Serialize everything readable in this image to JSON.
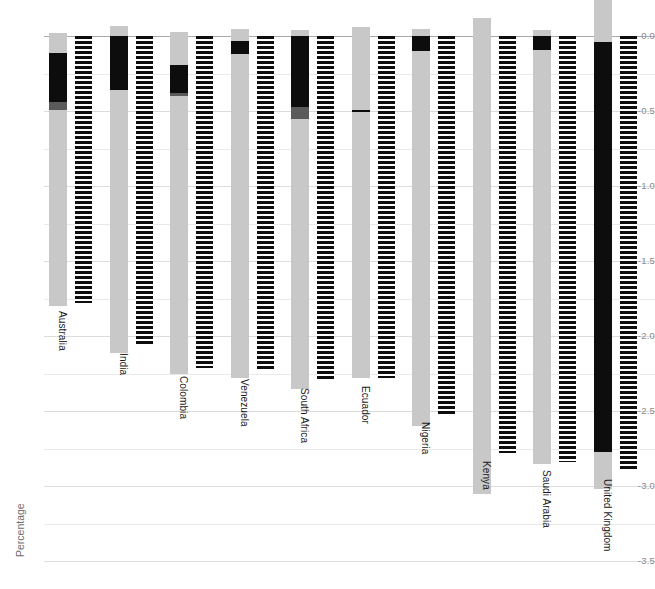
{
  "chart_data": {
    "type": "bar",
    "title": "",
    "xlabel": "",
    "ylabel": "Percentage",
    "ylim": [
      -3.62,
      0.32
    ],
    "grid": true,
    "gridline_step": 0.25,
    "legend": "none",
    "ytick_labels": [
      "0.0",
      "-0.5",
      "-1.0",
      "-1.5",
      "-2.0",
      "-2.5",
      "-3.0",
      "-3.5"
    ],
    "ytick_values": [
      0.0,
      -0.5,
      -1.0,
      -1.5,
      -2.0,
      -2.5,
      -3.0,
      -3.5
    ],
    "categories": [
      "Australia",
      "India",
      "Colombia",
      "Venezuela",
      "South Africa",
      "Ecuador",
      "Nigeria",
      "Kenya",
      "Saudi Arabia",
      "United Kingdom"
    ],
    "series": [
      {
        "name": "solid-bar",
        "style": "solid-grey",
        "color": "#c8c8c8",
        "tops": [
          0.02,
          0.07,
          0.03,
          0.05,
          0.04,
          0.06,
          0.05,
          0.12,
          0.04,
          0.24
        ],
        "values": [
          -1.8,
          -2.11,
          -2.25,
          -2.28,
          -2.35,
          -2.28,
          -2.6,
          -3.05,
          -2.85,
          -3.02
        ]
      },
      {
        "name": "hatched-bar",
        "style": "hatched-black",
        "color": "#0d0d0d",
        "tops": [
          0.0,
          0.0,
          0.0,
          0.0,
          0.0,
          0.0,
          0.0,
          0.0,
          0.0,
          0.0
        ],
        "values": [
          -1.78,
          -2.06,
          -2.21,
          -2.23,
          -2.29,
          -2.28,
          -2.52,
          -2.78,
          -2.84,
          -2.9
        ]
      }
    ],
    "overlay_segments": [
      {
        "category": "Australia",
        "black_from": -0.11,
        "black_to": -0.44,
        "dark_from": -0.44,
        "dark_to": -0.49
      },
      {
        "category": "India",
        "black_from": 0.0,
        "black_to": -0.36,
        "dark_from": null,
        "dark_to": null
      },
      {
        "category": "Colombia",
        "black_from": -0.19,
        "black_to": -0.38,
        "dark_from": -0.38,
        "dark_to": -0.4
      },
      {
        "category": "Venezuela",
        "black_from": -0.03,
        "black_to": -0.12,
        "dark_from": null,
        "dark_to": null
      },
      {
        "category": "South Africa",
        "black_from": 0.0,
        "black_to": -0.47,
        "dark_from": -0.47,
        "dark_to": -0.55
      },
      {
        "category": "Ecuador",
        "black_from": -0.49,
        "black_to": -0.51,
        "dark_from": null,
        "dark_to": null
      },
      {
        "category": "Nigeria",
        "black_from": 0.0,
        "black_to": -0.1,
        "dark_from": null,
        "dark_to": null
      },
      {
        "category": "Kenya",
        "black_from": null,
        "black_to": null,
        "dark_from": null,
        "dark_to": null
      },
      {
        "category": "Saudi Arabia",
        "black_from": 0.0,
        "black_to": -0.09,
        "dark_from": null,
        "dark_to": null
      },
      {
        "category": "United Kingdom",
        "black_from": -0.04,
        "black_to": -2.77,
        "dark_from": null,
        "dark_to": null
      }
    ]
  },
  "axis": {
    "y_title": "Percentage"
  },
  "caption": {
    "text": ""
  }
}
